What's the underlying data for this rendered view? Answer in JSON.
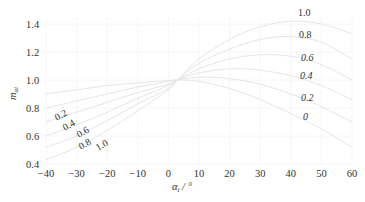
{
  "chart_data": {
    "type": "line",
    "title": "",
    "xlabel": "α_i / °",
    "ylabel": "m_ai",
    "xlim": [
      -40,
      60
    ],
    "ylim": [
      0.4,
      1.45
    ],
    "grid": true,
    "legend": "inline curve labels",
    "x_ticks": [
      -40,
      -30,
      -20,
      -10,
      0,
      10,
      20,
      30,
      40,
      50,
      60
    ],
    "x_tick_labels": [
      "−40",
      "−30",
      "−20",
      "−10",
      "0",
      "10",
      "20",
      "30",
      "40",
      "50",
      "60"
    ],
    "y_ticks": [
      0.4,
      0.6,
      0.8,
      1.0,
      1.2,
      1.4
    ],
    "y_tick_labels": [
      "0.4",
      "0.6",
      "0.8",
      "1.0",
      "1.2",
      "1.4"
    ],
    "x": [
      -40,
      -30,
      -20,
      -10,
      0,
      3,
      10,
      20,
      30,
      40,
      50,
      60
    ],
    "series": [
      {
        "name": "0",
        "values": [
          0.9,
          0.93,
          0.96,
          0.98,
          0.995,
          1.0,
          0.99,
          0.94,
          0.86,
          0.76,
          0.65,
          0.52
        ]
      },
      {
        "name": "0.2",
        "values": [
          0.8,
          0.85,
          0.9,
          0.95,
          0.99,
          1.0,
          1.02,
          1.01,
          0.97,
          0.9,
          0.81,
          0.7
        ]
      },
      {
        "name": "0.4",
        "values": [
          0.7,
          0.77,
          0.84,
          0.91,
          0.97,
          1.0,
          1.05,
          1.08,
          1.07,
          1.03,
          0.96,
          0.86
        ]
      },
      {
        "name": "0.6",
        "values": [
          0.6,
          0.68,
          0.77,
          0.87,
          0.96,
          1.0,
          1.08,
          1.15,
          1.18,
          1.17,
          1.11,
          1.0
        ]
      },
      {
        "name": "0.8",
        "values": [
          0.52,
          0.6,
          0.71,
          0.83,
          0.94,
          1.0,
          1.12,
          1.22,
          1.29,
          1.31,
          1.27,
          1.15
        ]
      },
      {
        "name": "1.0",
        "values": [
          0.43,
          0.52,
          0.64,
          0.78,
          0.93,
          1.0,
          1.15,
          1.29,
          1.38,
          1.42,
          1.4,
          1.33
        ]
      }
    ],
    "annotations": {
      "right_labels": [
        "1.0",
        "0.8",
        "0.6",
        "0.4",
        "0.2",
        "0"
      ],
      "left_labels": [
        "0.2",
        "0.4",
        "0.6",
        "0.8",
        "1.0"
      ]
    }
  },
  "labels": {
    "xlabel_main": "α",
    "xlabel_sub": "i",
    "xlabel_unit": " / °",
    "ylabel_main": "m",
    "ylabel_sub": "ai",
    "right": {
      "l10": "1.0",
      "l08": "0.8",
      "l06": "0.6",
      "l04": "0.4",
      "l02": "0.2",
      "l0": "0"
    },
    "left": {
      "l02": "0.2",
      "l04": "0.4",
      "l06": "0.6",
      "l08": "0.8",
      "l10": "1.0"
    }
  }
}
